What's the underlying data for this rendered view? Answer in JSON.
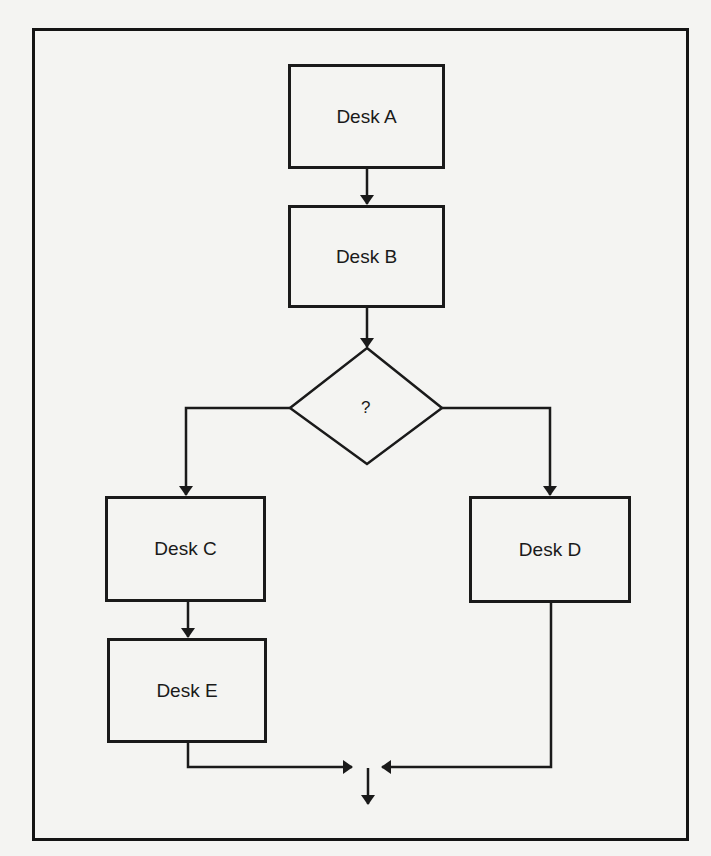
{
  "diagram": {
    "type": "flowchart",
    "nodes": [
      {
        "id": "A",
        "label": "Desk A",
        "shape": "rectangle"
      },
      {
        "id": "B",
        "label": "Desk B",
        "shape": "rectangle"
      },
      {
        "id": "Q",
        "label": "?",
        "shape": "diamond"
      },
      {
        "id": "C",
        "label": "Desk C",
        "shape": "rectangle"
      },
      {
        "id": "D",
        "label": "Desk D",
        "shape": "rectangle"
      },
      {
        "id": "E",
        "label": "Desk E",
        "shape": "rectangle"
      }
    ],
    "edges": [
      {
        "from": "A",
        "to": "B"
      },
      {
        "from": "B",
        "to": "Q"
      },
      {
        "from": "Q",
        "to": "C"
      },
      {
        "from": "Q",
        "to": "D"
      },
      {
        "from": "C",
        "to": "E"
      },
      {
        "from": "E",
        "to": "merge"
      },
      {
        "from": "D",
        "to": "merge"
      },
      {
        "from": "merge",
        "to": "output"
      }
    ],
    "colors": {
      "line": "#1a1a1a",
      "background": "#f4f4f2"
    }
  }
}
